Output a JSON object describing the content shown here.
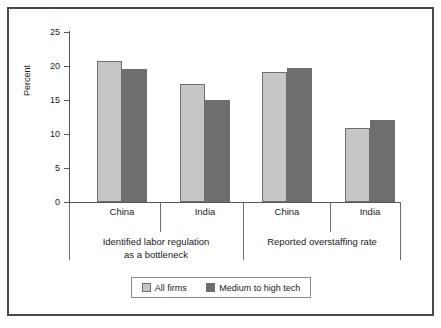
{
  "chart_data": {
    "type": "bar",
    "title": "",
    "subtitle": "",
    "xlabel": "",
    "ylabel": "Percent",
    "ylim": [
      0,
      25
    ],
    "yticks": [
      0,
      5,
      10,
      15,
      20,
      25
    ],
    "ytick_labels": [
      "0",
      "5",
      "10",
      "15",
      "20",
      "25"
    ],
    "grid": false,
    "legend_position": "bottom",
    "categories": [
      "China",
      "India",
      "China",
      "India"
    ],
    "groups": [
      {
        "label_line1": "Identified labor regulation",
        "label_line2": "as a bottleneck",
        "categories": [
          "China",
          "India"
        ]
      },
      {
        "label_line1": "Reported overstaffing rate",
        "label_line2": "",
        "categories": [
          "China",
          "India"
        ]
      }
    ],
    "series": [
      {
        "name": "All firms",
        "color": "#c6c6c6",
        "values": [
          20.7,
          17.3,
          19.1,
          10.9
        ]
      },
      {
        "name": "Medium to high tech",
        "color": "#6e6e6e",
        "values": [
          19.6,
          15.0,
          19.7,
          12.1
        ]
      }
    ]
  },
  "legend": {
    "items": [
      {
        "label": "All firms",
        "color": "#c6c6c6"
      },
      {
        "label": "Medium to high tech",
        "color": "#6e6e6e"
      }
    ]
  },
  "axis": {
    "y_title": "Percent",
    "y_tick_labels": [
      "25",
      "20",
      "15",
      "10",
      "5",
      "0"
    ]
  },
  "colors": {
    "series_light": "#c6c6c6",
    "series_dark": "#6e6e6e",
    "axis": "#555555",
    "frame": "#4a4a4a",
    "text": "#1a1a1a",
    "background": "#ffffff"
  }
}
